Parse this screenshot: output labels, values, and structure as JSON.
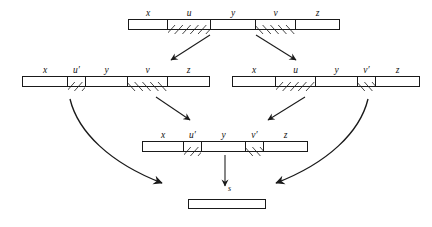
{
  "figure": {
    "ink_color": "#1a1a1a",
    "background": "#ffffff"
  },
  "bars": [
    {
      "id": "top",
      "name": "bar-top",
      "segments": [
        {
          "label": "x",
          "fill": "plain",
          "width": 38
        },
        {
          "label": "u",
          "fill": "hatch-forward",
          "width": 43
        },
        {
          "label": "y",
          "fill": "plain",
          "width": 45
        },
        {
          "label": "v",
          "fill": "hatch-back",
          "width": 40
        },
        {
          "label": "z",
          "fill": "plain",
          "width": 44
        }
      ]
    },
    {
      "id": "mid-left",
      "name": "bar-mid-left",
      "segments": [
        {
          "label": "x",
          "fill": "plain",
          "width": 44
        },
        {
          "label": "u′",
          "fill": "hatch-forward",
          "width": 18
        },
        {
          "label": "y",
          "fill": "plain",
          "width": 42
        },
        {
          "label": "v",
          "fill": "hatch-back",
          "width": 40
        },
        {
          "label": "z",
          "fill": "plain",
          "width": 42
        }
      ]
    },
    {
      "id": "mid-right",
      "name": "bar-mid-right",
      "segments": [
        {
          "label": "x",
          "fill": "plain",
          "width": 42
        },
        {
          "label": "u",
          "fill": "hatch-forward",
          "width": 40
        },
        {
          "label": "y",
          "fill": "plain",
          "width": 42
        },
        {
          "label": "v′",
          "fill": "hatch-back",
          "width": 18
        },
        {
          "label": "z",
          "fill": "plain",
          "width": 44
        }
      ]
    },
    {
      "id": "lower-mid",
      "name": "bar-lower-mid",
      "segments": [
        {
          "label": "x",
          "fill": "plain",
          "width": 40
        },
        {
          "label": "u′",
          "fill": "hatch-forward",
          "width": 18
        },
        {
          "label": "y",
          "fill": "plain",
          "width": 44
        },
        {
          "label": "v′",
          "fill": "hatch-back",
          "width": 18
        },
        {
          "label": "z",
          "fill": "plain",
          "width": 44
        }
      ]
    },
    {
      "id": "final",
      "name": "bar-final",
      "segments": [
        {
          "label": "",
          "fill": "plain",
          "width": 76
        }
      ]
    }
  ],
  "arrows": [
    {
      "name": "arrow-top-to-mid-left",
      "kind": "straight",
      "label": ""
    },
    {
      "name": "arrow-top-to-mid-right",
      "kind": "straight",
      "label": ""
    },
    {
      "name": "arrow-mid-left-to-lower",
      "kind": "straight",
      "label": ""
    },
    {
      "name": "arrow-mid-right-to-lower",
      "kind": "straight",
      "label": ""
    },
    {
      "name": "arrow-mid-left-to-final",
      "kind": "curved",
      "label": ""
    },
    {
      "name": "arrow-mid-right-to-final",
      "kind": "curved",
      "label": ""
    },
    {
      "name": "arrow-lower-to-final",
      "kind": "straight-vertical",
      "label": "s"
    }
  ],
  "labels": {
    "final_arrow": "s"
  }
}
